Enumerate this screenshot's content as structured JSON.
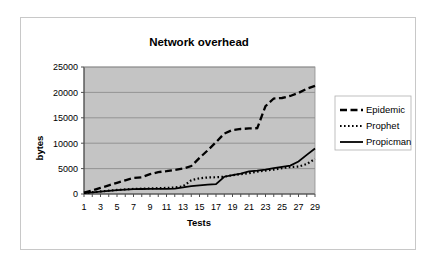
{
  "chart_data": {
    "type": "line",
    "title": "Network overhead",
    "xlabel": "Tests",
    "ylabel": "bytes",
    "xlim": [
      1,
      29
    ],
    "ylim": [
      0,
      25000
    ],
    "ytick_labels": [
      "0",
      "5000",
      "10000",
      "15000",
      "20000",
      "25000"
    ],
    "yticks": [
      0,
      5000,
      10000,
      15000,
      20000,
      25000
    ],
    "xtick_labels": [
      "1",
      "3",
      "5",
      "7",
      "9",
      "11",
      "13",
      "15",
      "17",
      "19",
      "21",
      "23",
      "25",
      "27",
      "29"
    ],
    "xticks": [
      1,
      3,
      5,
      7,
      9,
      11,
      13,
      15,
      17,
      19,
      21,
      23,
      25,
      27,
      29
    ],
    "grid": true,
    "plot_background": "#c4c4c4",
    "legend_position": "right",
    "x": [
      1,
      2,
      3,
      4,
      5,
      6,
      7,
      8,
      9,
      10,
      11,
      12,
      13,
      14,
      15,
      16,
      17,
      18,
      19,
      20,
      21,
      22,
      23,
      24,
      25,
      26,
      27,
      28,
      29
    ],
    "series": [
      {
        "name": "Epidemic",
        "dash": "long-dash",
        "color": "#000000",
        "values": [
          250,
          700,
          1200,
          1700,
          2200,
          2700,
          3150,
          3300,
          3900,
          4300,
          4500,
          4750,
          5000,
          5500,
          7100,
          8600,
          10200,
          11900,
          12600,
          12800,
          12900,
          12950,
          17300,
          18800,
          18900,
          19300,
          19900,
          20700,
          21300
        ]
      },
      {
        "name": "Prophet",
        "dash": "dotted",
        "color": "#000000",
        "values": [
          200,
          350,
          500,
          650,
          800,
          900,
          1000,
          1050,
          1100,
          1150,
          1200,
          1300,
          1500,
          2700,
          3100,
          3250,
          3300,
          3400,
          3700,
          3900,
          4100,
          4400,
          4600,
          4800,
          5100,
          5300,
          5400,
          5900,
          6900
        ]
      },
      {
        "name": "Propicman",
        "dash": "solid",
        "color": "#000000",
        "values": [
          200,
          330,
          480,
          620,
          760,
          860,
          940,
          980,
          1000,
          1000,
          1000,
          1050,
          1300,
          1550,
          1700,
          1850,
          1950,
          3400,
          3700,
          4000,
          4450,
          4600,
          4800,
          5100,
          5350,
          5600,
          6400,
          7700,
          8950
        ]
      }
    ]
  }
}
